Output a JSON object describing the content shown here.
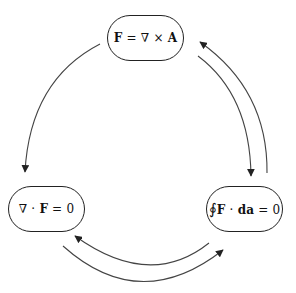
{
  "diagram": {
    "type": "cycle",
    "nodes": [
      {
        "id": "top",
        "label": "F = ∇ × A",
        "parts": [
          {
            "t": "F",
            "b": true
          },
          {
            "t": " = ∇ × ",
            "b": false
          },
          {
            "t": "A",
            "b": true
          }
        ]
      },
      {
        "id": "left",
        "label": "∇ · F = 0",
        "parts": [
          {
            "t": "∇ · ",
            "b": false
          },
          {
            "t": "F",
            "b": true
          },
          {
            "t": " = 0",
            "b": false
          }
        ]
      },
      {
        "id": "right",
        "label": "∮F · da = 0",
        "parts": [
          {
            "t": "∮",
            "b": false
          },
          {
            "t": "F",
            "b": true
          },
          {
            "t": " · ",
            "b": false
          },
          {
            "t": "da",
            "b": true
          },
          {
            "t": " = 0",
            "b": false
          }
        ]
      }
    ],
    "edges": [
      {
        "from": "top",
        "to": "left"
      },
      {
        "from": "top",
        "to": "right"
      },
      {
        "from": "right",
        "to": "top"
      },
      {
        "from": "right",
        "to": "left"
      },
      {
        "from": "left",
        "to": "right"
      }
    ],
    "colors": {
      "stroke": "#444444",
      "text": "#111111",
      "background": "#ffffff"
    }
  }
}
